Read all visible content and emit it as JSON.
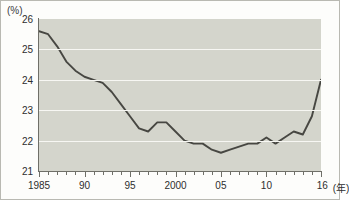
{
  "figure": {
    "unit_label": "(%)",
    "xaxis_unit_label": "(年)",
    "background_color": "#d4d5cc",
    "line_color": "#474742",
    "grid_color": "#f7f7f3",
    "axis_color": "#6f6f68"
  },
  "chart_data": {
    "type": "line",
    "title": "",
    "subtitle": "",
    "xlabel": "(年)",
    "ylabel": "(%)",
    "ylim": [
      21,
      26
    ],
    "xlim": [
      1985,
      2016
    ],
    "grid": true,
    "legend": "none",
    "ytick_labels": [
      "26",
      "25",
      "24",
      "23",
      "22",
      "21"
    ],
    "ytick_values": [
      26,
      25,
      24,
      23,
      22,
      21
    ],
    "xtick_labels": [
      "1985",
      "90",
      "95",
      "2000",
      "05",
      "10",
      "16"
    ],
    "xtick_values": [
      1985,
      1990,
      1995,
      2000,
      2005,
      2010,
      2016
    ],
    "series": [
      {
        "name": "",
        "x": [
          1985,
          1986,
          1987,
          1988,
          1989,
          1990,
          1991,
          1992,
          1993,
          1994,
          1995,
          1996,
          1997,
          1998,
          1999,
          2000,
          2001,
          2002,
          2003,
          2004,
          2005,
          2006,
          2007,
          2008,
          2009,
          2010,
          2011,
          2012,
          2013,
          2014,
          2015,
          2016
        ],
        "values": [
          25.6,
          25.5,
          25.1,
          24.6,
          24.3,
          24.1,
          24.0,
          23.9,
          23.6,
          23.2,
          22.8,
          22.4,
          22.3,
          22.6,
          22.6,
          22.3,
          22.0,
          21.9,
          21.9,
          21.7,
          21.6,
          21.7,
          21.8,
          21.9,
          21.9,
          22.1,
          21.9,
          22.1,
          22.3,
          22.2,
          22.8,
          24.0
        ]
      }
    ]
  }
}
